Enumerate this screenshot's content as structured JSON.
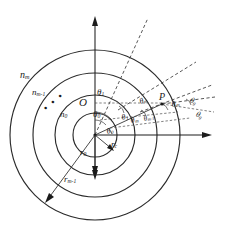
{
  "figure": {
    "type": "geometry-diagram",
    "background_color": "#ffffff",
    "stroke_color": "#2b2b2b",
    "center_label": "O",
    "point_label": "P",
    "refractive_index_labels": [
      {
        "name": "n-m",
        "text": "n",
        "sub": "m"
      },
      {
        "name": "n-m-minus-1",
        "text": "n",
        "sub": "m-1"
      },
      {
        "name": "n-0",
        "text": "n",
        "sub": "0"
      }
    ],
    "ellipsis": "• • •",
    "radius_labels": [
      {
        "name": "r-c",
        "text": "r",
        "sub": "c"
      },
      {
        "name": "r-0",
        "text": "r",
        "sub": "0"
      },
      {
        "name": "r-m-minus-1",
        "text": "r",
        "sub": "m-1"
      }
    ],
    "angle_labels": [
      {
        "name": "theta-1-top",
        "text": "θ",
        "sub": "1"
      },
      {
        "name": "theta-0-inner",
        "text": "θ",
        "sub": "0"
      },
      {
        "name": "theta-0-lower",
        "text": "θ",
        "sub": "0"
      },
      {
        "name": "theta-1-mid",
        "text": "θ",
        "sub": "1"
      },
      {
        "name": "theta-m-left",
        "text": "θ",
        "sub": "m"
      },
      {
        "name": "theta-m-minus-1",
        "text": "θ",
        "sub": "m-1"
      },
      {
        "name": "theta-m-upper",
        "text": "θ",
        "sub": "m"
      },
      {
        "name": "theta-m-right",
        "text": "θ",
        "sub": "m"
      },
      {
        "name": "theta-g",
        "text": "θ",
        "sub": "g"
      },
      {
        "name": "theta-g-lower",
        "text": "θ",
        "sub": "g"
      }
    ],
    "axes": {
      "vertical_up_arrow": true,
      "vertical_down_arrow": true,
      "horizontal_right_arrow": true
    },
    "circles": [
      {
        "name": "circle-r-c",
        "radius_px": 22
      },
      {
        "name": "circle-r-0",
        "radius_px": 40
      },
      {
        "name": "circle-inner-mid",
        "radius_px": 62
      },
      {
        "name": "circle-r-m-minus-1",
        "radius_px": 85
      }
    ]
  }
}
